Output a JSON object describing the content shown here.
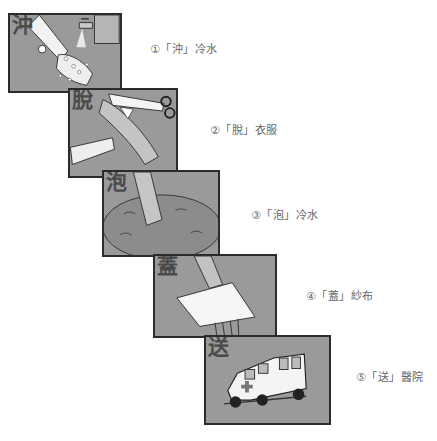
{
  "steps": [
    {
      "num": "①",
      "glyph": "沖",
      "caption": "①「沖」冷水",
      "scene": "hand-under-running-tap-icon"
    },
    {
      "num": "②",
      "glyph": "脫",
      "caption": "②「脫」衣服",
      "scene": "scissors-cutting-sleeve-icon"
    },
    {
      "num": "③",
      "glyph": "泡",
      "caption": "③「泡」冷水",
      "scene": "arm-soaking-in-water-icon"
    },
    {
      "num": "④",
      "glyph": "蓋",
      "caption": "④「蓋」紗布",
      "scene": "gauze-over-hand-icon"
    },
    {
      "num": "⑤",
      "glyph": "送",
      "caption": "⑤「送」醫院",
      "scene": "ambulance-icon"
    }
  ],
  "colors": {
    "panel_bg": "#9a9a9a",
    "panel_border": "#2b2b2b",
    "caption": "#666666",
    "glyph": "#4a4a4a"
  }
}
